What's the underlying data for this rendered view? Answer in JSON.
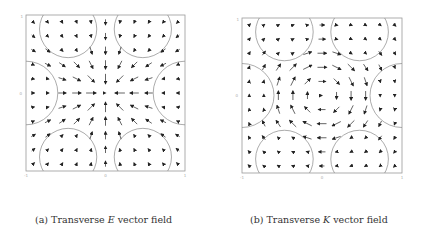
{
  "figure": {
    "panels": [
      {
        "id": "a",
        "caption_prefix": "(a) Transverse ",
        "caption_var": "E",
        "caption_suffix": " vector field",
        "field_type": "radial-inward",
        "box": {
          "left": 26,
          "top": 15,
          "width": 159,
          "height": 156
        },
        "caption_pos": {
          "left": 35,
          "top": 214
        }
      },
      {
        "id": "b",
        "caption_prefix": "(b) Transverse ",
        "caption_var": "K",
        "caption_suffix": " vector field",
        "field_type": "rotational-clockwise",
        "box": {
          "left": 242,
          "top": 18,
          "width": 160,
          "height": 155
        },
        "caption_pos": {
          "left": 250,
          "top": 214
        }
      }
    ],
    "axes": {
      "x_ticks": [
        "-1",
        "0",
        "1"
      ],
      "y_ticks": [
        "-1",
        "0",
        "1"
      ],
      "xlim": [
        -1,
        1
      ],
      "ylim": [
        -1,
        1
      ]
    },
    "circles": [
      {
        "cx": -0.47,
        "cy": 0.82,
        "r": 0.36
      },
      {
        "cx": 0.47,
        "cy": 0.82,
        "r": 0.36
      },
      {
        "cx": -1.0,
        "cy": 0.0,
        "r": 0.4
      },
      {
        "cx": 1.0,
        "cy": 0.0,
        "r": 0.4
      },
      {
        "cx": -0.47,
        "cy": -0.82,
        "r": 0.36
      },
      {
        "cx": 0.47,
        "cy": -0.82,
        "r": 0.36
      }
    ],
    "colors": {
      "arrow": "#222222",
      "circle": "#888888",
      "frame": "#999999",
      "caption": "#333333"
    }
  }
}
